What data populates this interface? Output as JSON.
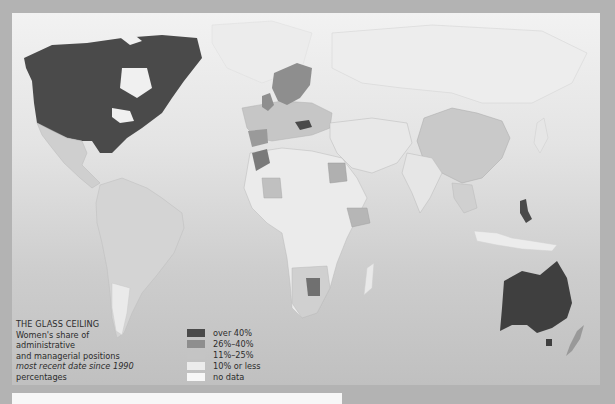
{
  "caption": {
    "title": "THE GLASS CEILING",
    "line1": "Women's share of",
    "line2": "administrative",
    "line3": "and managerial positions",
    "line4_italic": "most recent date since 1990",
    "line5": "percentages"
  },
  "legend": {
    "items": [
      {
        "label": "over 40%",
        "color": "#4a4a4a"
      },
      {
        "label": "26%–40%",
        "color": "#8e8e8e"
      },
      {
        "label": "11%–25%",
        "color": "#c4c4c4"
      },
      {
        "label": "10% or less",
        "color": "#ececec"
      },
      {
        "label": "no data",
        "color": "#f7f7f7"
      }
    ]
  },
  "regions": {
    "over_40": [
      "Canada",
      "United States",
      "Australia",
      "Philippines",
      "Hungary",
      "Botswana",
      "Lesotho"
    ],
    "26_40": [
      "Sweden",
      "Norway",
      "Finland",
      "United Kingdom",
      "Morocco",
      "Mali",
      "Ethiopia",
      "Egypt"
    ],
    "11_25": [
      "China",
      "Mexico",
      "South America",
      "Europe (various)",
      "Southern Africa (various)",
      "New Zealand"
    ],
    "10_or_less": [
      "Africa (various)",
      "Middle East",
      "India"
    ],
    "no_data": [
      "Russia",
      "Greenland"
    ]
  }
}
